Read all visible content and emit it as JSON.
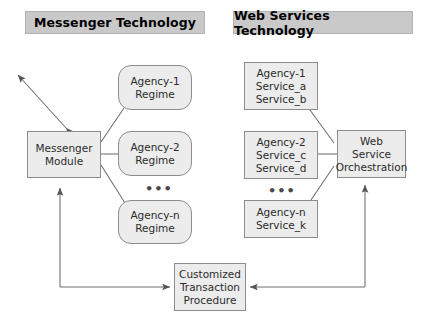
{
  "diagram": {
    "headers": [
      {
        "id": "messenger-technology",
        "label": "Messenger Technology"
      },
      {
        "id": "web-services-technology",
        "label": "Web Services Technology"
      }
    ],
    "nodes": [
      {
        "id": "messenger-module",
        "lines": [
          "Messenger",
          "Module"
        ]
      },
      {
        "id": "agency-1-regime",
        "lines": [
          "Agency-1",
          "Regime"
        ]
      },
      {
        "id": "agency-2-regime",
        "lines": [
          "Agency-2",
          "Regime"
        ]
      },
      {
        "id": "agency-n-regime",
        "lines": [
          "Agency-n",
          "Regime"
        ]
      },
      {
        "id": "agency-1-services",
        "lines": [
          "Agency-1",
          "Service_a",
          "Service_b"
        ]
      },
      {
        "id": "agency-2-services",
        "lines": [
          "Agency-2",
          "Service_c",
          "Service_d"
        ]
      },
      {
        "id": "agency-n-services",
        "lines": [
          "Agency-n",
          "Service_k"
        ]
      },
      {
        "id": "web-service-orchestration",
        "lines": [
          "Web",
          "Service",
          "Orchestration"
        ]
      },
      {
        "id": "customized-transaction-procedure",
        "lines": [
          "Customized",
          "Transaction",
          "Procedure"
        ]
      }
    ],
    "ellipsis": [
      {
        "id": "ellipsis-regime",
        "text": "•••"
      },
      {
        "id": "ellipsis-services",
        "text": "•••"
      }
    ],
    "colors": {
      "header_fill": "#c9c9c9",
      "header_border": "#b2b2b2",
      "node_fill": "#ececec",
      "node_border": "#8c8c8c",
      "connector": "#6e6e6e",
      "text": "#2b2b2b",
      "background": "#ffffff"
    }
  }
}
